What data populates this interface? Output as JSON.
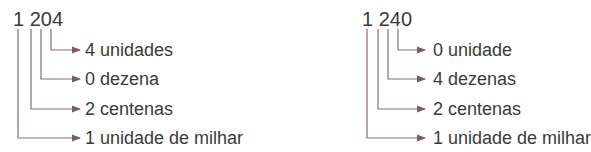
{
  "diagrams": [
    {
      "number": "1 204",
      "labels": [
        "4 unidades",
        "0 dezena",
        "2 centenas",
        "1 unidade de milhar"
      ]
    },
    {
      "number": "1 240",
      "labels": [
        "0 unidade",
        "4 dezenas",
        "2 centenas",
        "1 unidade de milhar"
      ]
    }
  ],
  "colors": {
    "line": "#8a6a78",
    "text": "#3a3a3a"
  }
}
